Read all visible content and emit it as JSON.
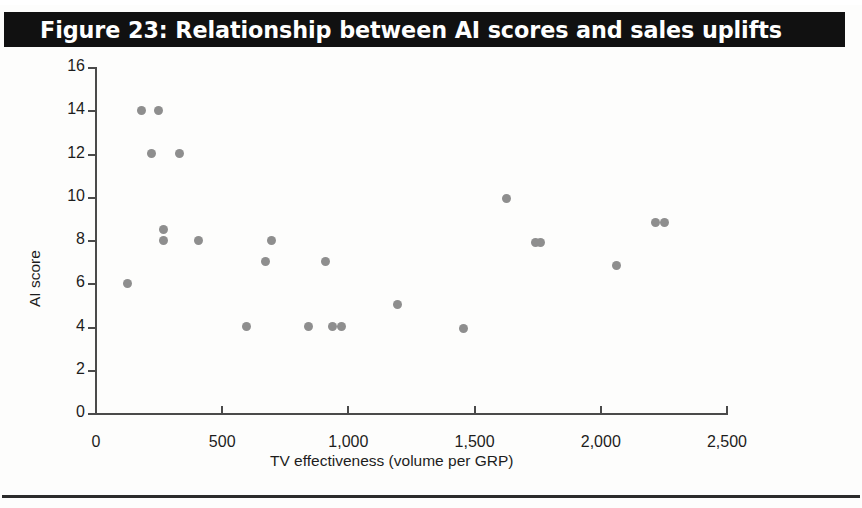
{
  "figure": {
    "title": "Figure 23: Relationship between AI scores and sales uplifts",
    "title_bg": "#111111",
    "title_color": "#ffffff",
    "marker_color": "#8e8e8e",
    "axis_color": "#4a4a4a",
    "rule_color": "#2b2b2b"
  },
  "chart_data": {
    "type": "scatter",
    "title": "Figure 23: Relationship between AI scores and sales uplifts",
    "xlabel": "TV effectiveness (volume per GRP)",
    "ylabel": "AI score",
    "xlim": [
      0,
      2500
    ],
    "ylim": [
      0,
      16
    ],
    "xticks": [
      0,
      500,
      1000,
      1500,
      2000,
      2500
    ],
    "xtick_labels": [
      "0",
      "500",
      "1,000",
      "1,500",
      "2,000",
      "2,500"
    ],
    "yticks": [
      0,
      2,
      4,
      6,
      8,
      10,
      12,
      14,
      16
    ],
    "ytick_labels": [
      "0",
      "2",
      "4",
      "6",
      "8",
      "10",
      "12",
      "14",
      "16"
    ],
    "grid": false,
    "legend": false,
    "series": [
      {
        "name": "Brands",
        "marker": "circle",
        "color": "#8e8e8e",
        "points": [
          {
            "x": 130,
            "y": 6.0
          },
          {
            "x": 185,
            "y": 14.0
          },
          {
            "x": 250,
            "y": 14.0
          },
          {
            "x": 225,
            "y": 12.0
          },
          {
            "x": 335,
            "y": 12.0
          },
          {
            "x": 270,
            "y": 8.5
          },
          {
            "x": 270,
            "y": 8.0
          },
          {
            "x": 410,
            "y": 8.0
          },
          {
            "x": 600,
            "y": 4.0
          },
          {
            "x": 675,
            "y": 7.0
          },
          {
            "x": 700,
            "y": 8.0
          },
          {
            "x": 845,
            "y": 4.0
          },
          {
            "x": 915,
            "y": 7.0
          },
          {
            "x": 940,
            "y": 4.0
          },
          {
            "x": 975,
            "y": 4.0
          },
          {
            "x": 1200,
            "y": 5.0
          },
          {
            "x": 1460,
            "y": 3.9
          },
          {
            "x": 1630,
            "y": 9.9
          },
          {
            "x": 1745,
            "y": 7.9
          },
          {
            "x": 1765,
            "y": 7.9
          },
          {
            "x": 2065,
            "y": 6.8
          },
          {
            "x": 2220,
            "y": 8.8
          },
          {
            "x": 2255,
            "y": 8.8
          }
        ]
      }
    ]
  }
}
